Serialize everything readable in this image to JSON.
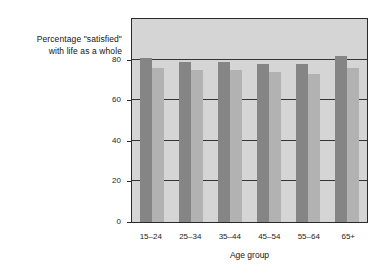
{
  "chart_data": {
    "type": "bar",
    "title": "",
    "subtitle": "",
    "ylabel_line1": "Percentage \"satisfied\"",
    "ylabel_line2": "with life as a whole",
    "xlabel": "Age group",
    "categories": [
      "15–24",
      "25–34",
      "35–44",
      "45–54",
      "55–64",
      "65+"
    ],
    "series": [
      {
        "name": "series-1",
        "color": "#858585",
        "values": [
          81,
          79,
          79,
          78,
          78,
          82
        ]
      },
      {
        "name": "series-2",
        "color": "#b2b2b2",
        "values": [
          76,
          75,
          75,
          74,
          73,
          76
        ]
      }
    ],
    "ylim": [
      0,
      100
    ],
    "yticks": [
      0,
      20,
      40,
      60,
      80
    ],
    "ytick_labels": [
      "0",
      "20",
      "40",
      "60",
      "80"
    ],
    "grid": true,
    "gridlines_at": [
      20,
      40,
      60,
      80
    ],
    "legend": null,
    "legend_position": "none",
    "plot_background": "#d5d5d5",
    "axis_color": "#2a2a2a",
    "text_color": "#1d1d1d"
  }
}
